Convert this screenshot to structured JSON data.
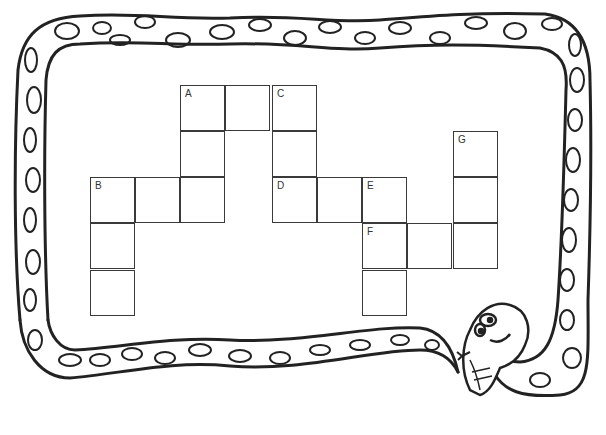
{
  "puzzle": {
    "type": "crossword",
    "theme": "snake border",
    "colors": {
      "line": "#333333",
      "background": "#ffffff"
    },
    "cells": [
      {
        "row": 0,
        "col": 2,
        "label": "A"
      },
      {
        "row": 0,
        "col": 3,
        "label": ""
      },
      {
        "row": 0,
        "col": 4,
        "label": "C"
      },
      {
        "row": 1,
        "col": 2,
        "label": ""
      },
      {
        "row": 1,
        "col": 4,
        "label": ""
      },
      {
        "row": 1,
        "col": 8,
        "label": "G"
      },
      {
        "row": 2,
        "col": 0,
        "label": "B"
      },
      {
        "row": 2,
        "col": 1,
        "label": ""
      },
      {
        "row": 2,
        "col": 2,
        "label": ""
      },
      {
        "row": 2,
        "col": 4,
        "label": "D"
      },
      {
        "row": 2,
        "col": 5,
        "label": ""
      },
      {
        "row": 2,
        "col": 6,
        "label": "E"
      },
      {
        "row": 2,
        "col": 8,
        "label": ""
      },
      {
        "row": 3,
        "col": 0,
        "label": ""
      },
      {
        "row": 3,
        "col": 6,
        "label": "F"
      },
      {
        "row": 3,
        "col": 7,
        "label": ""
      },
      {
        "row": 3,
        "col": 8,
        "label": ""
      },
      {
        "row": 4,
        "col": 0,
        "label": ""
      },
      {
        "row": 4,
        "col": 6,
        "label": ""
      }
    ]
  }
}
